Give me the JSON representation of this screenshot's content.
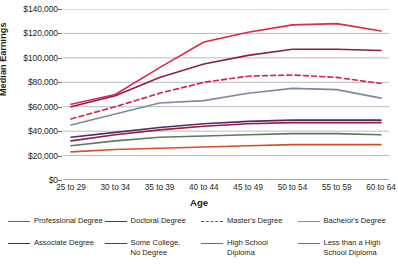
{
  "chart_data": {
    "type": "line",
    "title": "",
    "xlabel": "Age",
    "ylabel": "Median Earnings",
    "categories": [
      "25 to 29",
      "30 to 34",
      "35 to 39",
      "40 to 44",
      "45 to 49",
      "50 to 54",
      "55 to 59",
      "60 to 64"
    ],
    "ylim": [
      0,
      140000
    ],
    "ytick_values": [
      0,
      20000,
      40000,
      60000,
      80000,
      100000,
      120000,
      140000
    ],
    "ytick_labels": [
      "$0",
      "$20,000",
      "$40,000",
      "$60,000",
      "$80,000",
      "$100,000",
      "$120,000",
      "$140,000"
    ],
    "grid": "horizontal",
    "legend_position": "bottom",
    "series": [
      {
        "name": "Professional Degree",
        "legend_label": "Professional Degree",
        "color": "#e0264b",
        "dash": false,
        "values": [
          62000,
          70000,
          92000,
          113000,
          121000,
          127000,
          128000,
          122000
        ]
      },
      {
        "name": "Doctoral Degree",
        "legend_label": "Doctoral Degree",
        "color": "#8e1c4d",
        "dash": false,
        "values": [
          60000,
          69000,
          84000,
          95000,
          102000,
          107000,
          107000,
          106000
        ]
      },
      {
        "name": "Master's Degree",
        "legend_label": "Master's Degree",
        "color": "#d6224b",
        "dash": true,
        "values": [
          50000,
          60000,
          71000,
          80000,
          85000,
          86000,
          84000,
          79000
        ]
      },
      {
        "name": "Bachelor's Degree",
        "legend_label": "Bachelor's Degree",
        "color": "#7d8a9c",
        "dash": false,
        "values": [
          45000,
          54000,
          63000,
          65000,
          71000,
          75000,
          74000,
          67000
        ]
      },
      {
        "name": "Associate Degree",
        "legend_label": "Associate Degree",
        "color": "#4b2d6e",
        "dash": false,
        "values": [
          35000,
          39000,
          43000,
          46000,
          48000,
          49000,
          49000,
          49000
        ]
      },
      {
        "name": "Some College, No Degree",
        "legend_label": "Some College,\nNo Degree",
        "color": "#9e1b37",
        "dash": false,
        "values": [
          32000,
          37000,
          41000,
          44000,
          46000,
          47000,
          47000,
          47000
        ]
      },
      {
        "name": "High School Diploma",
        "legend_label": "High School\nDiploma",
        "color": "#5e7a5c",
        "dash": false,
        "values": [
          28000,
          32000,
          35000,
          36000,
          37000,
          38000,
          38000,
          37000
        ]
      },
      {
        "name": "Less than a High School Diploma",
        "legend_label": "Less than a High\nSchool Diploma",
        "color": "#d4502b",
        "dash": false,
        "values": [
          23000,
          25000,
          26000,
          27000,
          28000,
          29000,
          29000,
          29000
        ]
      }
    ]
  },
  "axis": {
    "y_title": "Median Earnings",
    "x_title": "Age"
  },
  "watermark": {
    "text": ""
  }
}
